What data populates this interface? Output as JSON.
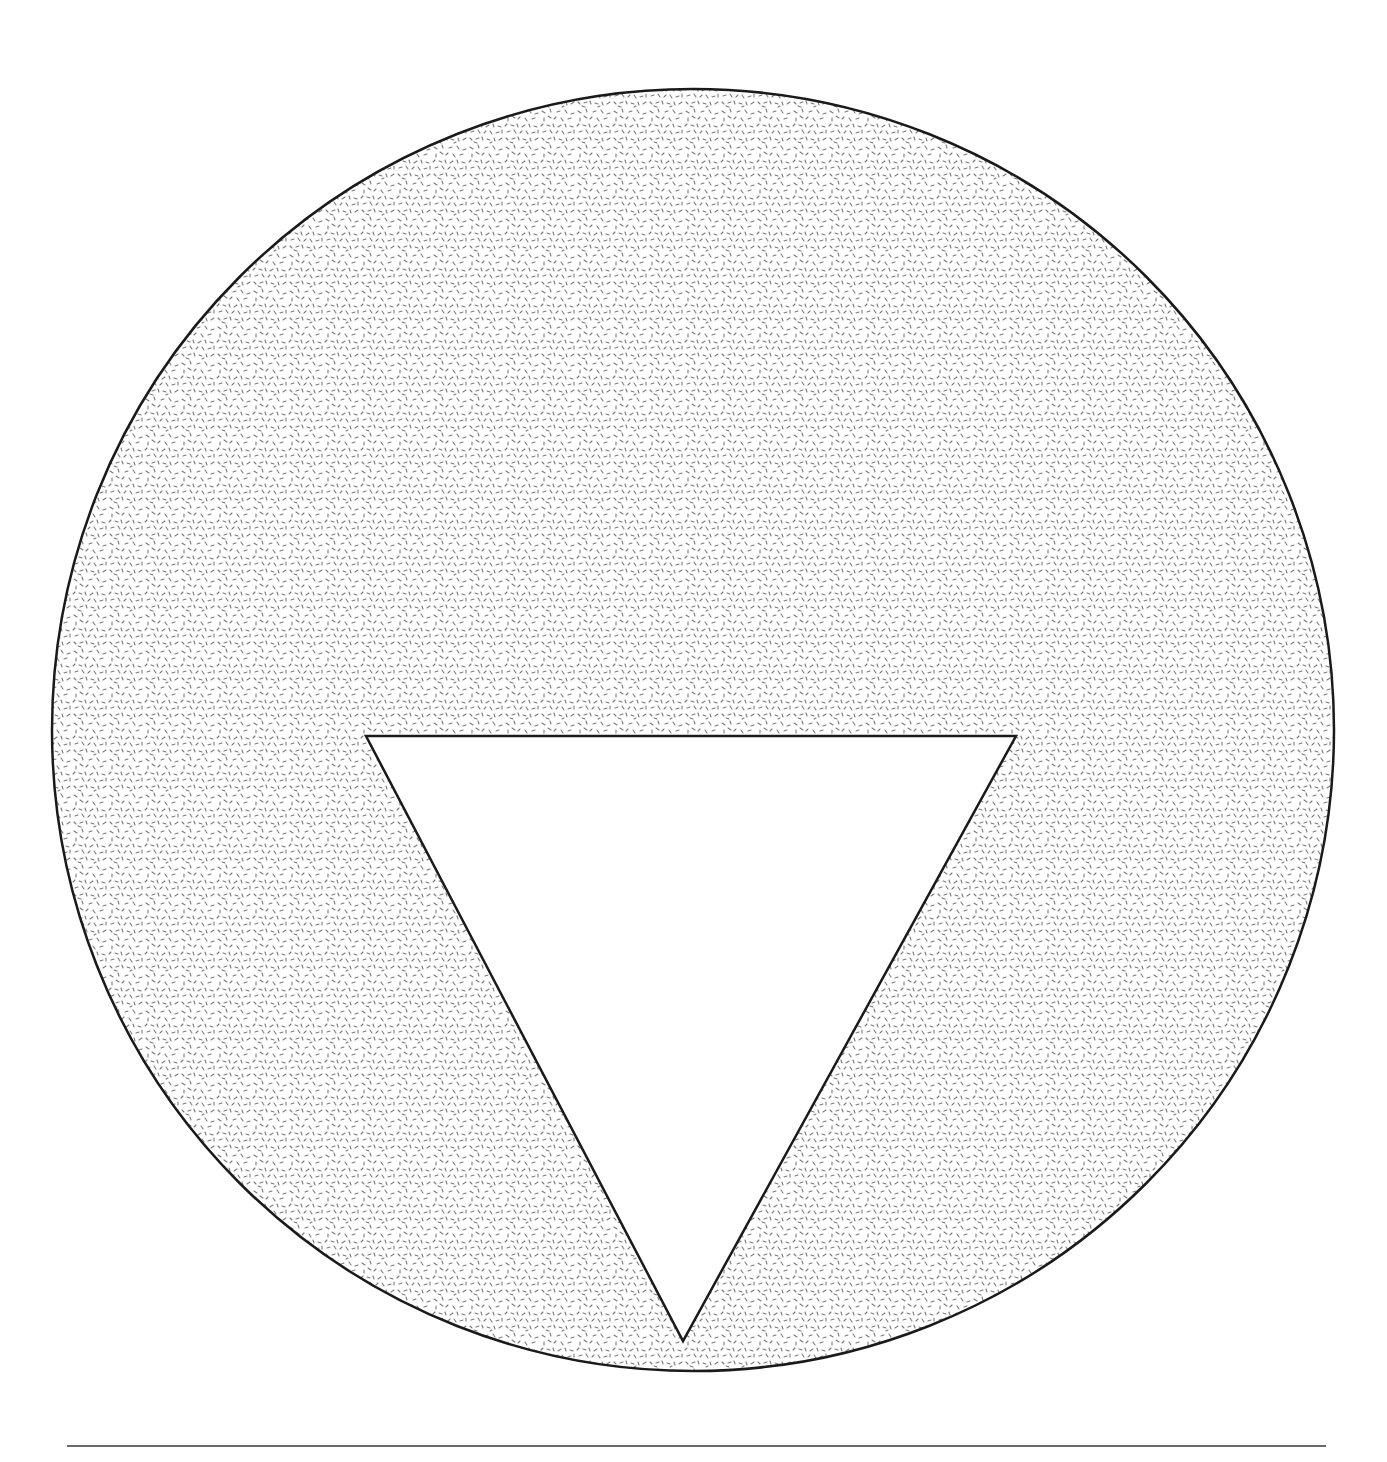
{
  "figure": {
    "shapes": {
      "circle": {
        "cx": 693,
        "cy": 730,
        "r": 641,
        "fill": "stipple",
        "stroke": "#1a1a1a"
      },
      "triangle": {
        "points": "366,736 1016,736 683,1341",
        "fill": "#ffffff",
        "stroke": "#1a1a1a"
      }
    },
    "colors": {
      "stroke": "#1a1a1a",
      "stipple": "#7a7a7a",
      "background": "#ffffff",
      "rule": "#6a6a6a"
    }
  },
  "caption": {
    "text": ""
  }
}
